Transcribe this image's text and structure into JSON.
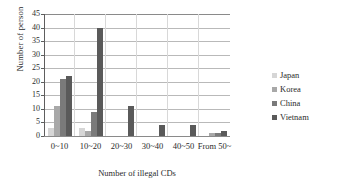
{
  "chart_data": {
    "type": "bar",
    "title": "",
    "xlabel": "Number of illegal CDs",
    "ylabel": "Number of person",
    "categories": [
      "0~10",
      "10~20",
      "20~30",
      "30~40",
      "40~50",
      "From 50~"
    ],
    "series": [
      {
        "name": "Japan",
        "color": "#d6d6d6",
        "values": [
          3,
          3,
          0,
          0,
          0,
          0
        ]
      },
      {
        "name": "Korea",
        "color": "#a8a8a8",
        "values": [
          11,
          2,
          0,
          0,
          0,
          1
        ]
      },
      {
        "name": "China",
        "color": "#7a7a7a",
        "values": [
          21,
          9,
          0,
          0,
          0,
          1
        ]
      },
      {
        "name": "Vietnam",
        "color": "#5a5a5a",
        "values": [
          22,
          40,
          11,
          4,
          4,
          2
        ]
      }
    ],
    "ylim": [
      0,
      45
    ],
    "yticks": [
      0,
      5,
      10,
      15,
      20,
      25,
      30,
      35,
      40,
      45
    ],
    "ytick_labels": [
      "0",
      "5",
      "10",
      "15",
      "20",
      "25",
      "30",
      "35",
      "40",
      "45"
    ],
    "grid": "horizontal",
    "legend_position": "right",
    "legend_entries": [
      "Japan",
      "Korea",
      "China",
      "Vietnam"
    ],
    "annotations": []
  }
}
